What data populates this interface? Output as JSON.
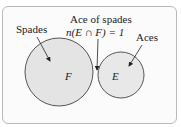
{
  "diagram": {
    "type": "venn",
    "sets": [
      {
        "id": "F",
        "symbol": "F",
        "label": "Spades"
      },
      {
        "id": "E",
        "symbol": "E",
        "label": "Aces"
      }
    ],
    "intersection": {
      "label": "Ace of spades",
      "formula": "n(E ∩ F) = 1"
    }
  },
  "labels": {
    "spades": "Spades",
    "aces": "Aces",
    "ace_of_spades": "Ace of spades",
    "formula": "n(E ∩ F) = 1",
    "set_f": "F",
    "set_e": "E"
  },
  "colors": {
    "fill": "#e4e4e4",
    "stroke": "#555555",
    "frame_border": "#b9b9b9"
  }
}
